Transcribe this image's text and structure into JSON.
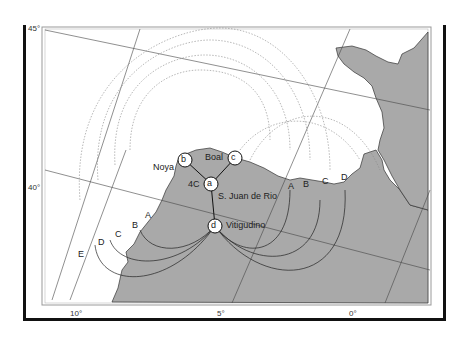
{
  "map": {
    "lat_labels": [
      "45°",
      "40°"
    ],
    "lon_labels": [
      "10°",
      "5°",
      "0°"
    ],
    "stations": [
      {
        "id": "a",
        "name": "S. Juan de Rio"
      },
      {
        "id": "b",
        "name": "Noya"
      },
      {
        "id": "c",
        "name": "Boal"
      },
      {
        "id": "d",
        "name": "Vitigudino"
      }
    ],
    "site_label": "4C",
    "contour_labels_east": [
      "A",
      "B",
      "C",
      "D"
    ],
    "contour_labels_west": [
      "A",
      "B",
      "C",
      "D",
      "E"
    ],
    "colors": {
      "land": "#a9a9a9",
      "sea": "#ffffff",
      "frame": "#111111"
    }
  }
}
